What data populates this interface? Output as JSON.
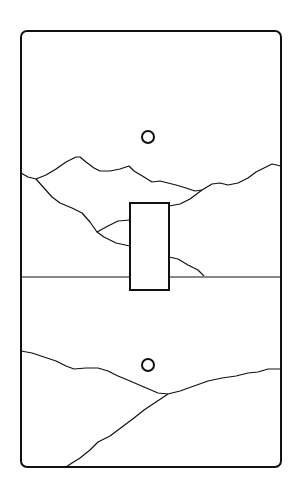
{
  "illustration": {
    "subject": "Single toggle light switch plate with mountain landscape line art",
    "colors": {
      "stroke": "#111111",
      "background": "#ffffff"
    },
    "plate": {
      "x": 21,
      "y": 31,
      "width": 260,
      "height": 436,
      "corner_radius": 6
    },
    "screws": [
      {
        "cx": 148,
        "cy": 137,
        "r": 6
      },
      {
        "cx": 148,
        "cy": 365,
        "r": 6
      }
    ],
    "toggle": {
      "x": 130,
      "y": 203,
      "width": 39,
      "height": 87
    },
    "horizon_y": 277
  }
}
